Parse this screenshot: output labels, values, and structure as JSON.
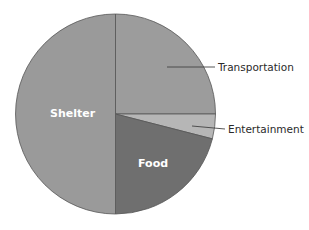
{
  "chart_data": {
    "type": "pie",
    "title": "",
    "start_angle_deg": 90,
    "direction": "clockwise",
    "slices": [
      {
        "label": "Transportation",
        "value": 25,
        "color": "#9c9c9c",
        "label_position": "outside"
      },
      {
        "label": "Entertainment",
        "value": 4,
        "color": "#b6b6b6",
        "label_position": "outside"
      },
      {
        "label": "Food",
        "value": 21,
        "color": "#6f6f6f",
        "label_position": "inside"
      },
      {
        "label": "Shelter",
        "value": 50,
        "color": "#9a9a9a",
        "label_position": "inside"
      }
    ],
    "categories": [
      "Transportation",
      "Entertainment",
      "Food",
      "Shelter"
    ],
    "values": [
      25,
      4,
      21,
      50
    ],
    "legend": "none",
    "units": "percent (estimated)"
  },
  "labels": {
    "transportation": "Transportation",
    "entertainment": "Entertainment",
    "food": "Food",
    "shelter": "Shelter"
  }
}
